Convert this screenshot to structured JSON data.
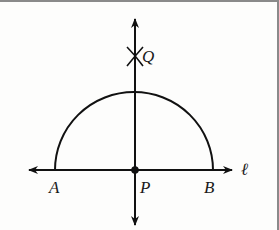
{
  "diagram": {
    "type": "geometric-construction",
    "colors": {
      "stroke": "#111111",
      "background": "#fdfdfc",
      "frame": "#8a8a8a"
    },
    "labels": {
      "A": "A",
      "B": "B",
      "P": "P",
      "Q": "Q",
      "line": "ℓ"
    },
    "points": {
      "A": [
        55,
        170
      ],
      "B": [
        213,
        170
      ],
      "P": [
        135,
        170
      ],
      "Q": [
        135,
        56
      ]
    },
    "lines": [
      {
        "name": "line-l",
        "from": [
          30,
          170
        ],
        "to": [
          232,
          170
        ],
        "arrows": "both"
      },
      {
        "name": "perpendicular",
        "from": [
          135,
          20
        ],
        "to": [
          135,
          224
        ],
        "arrows": "both"
      }
    ],
    "arcs": [
      {
        "name": "semicircle",
        "center": [
          135,
          170
        ],
        "radius": 79,
        "from": "A",
        "to": "B"
      }
    ],
    "marks": [
      {
        "name": "arc-intersection-x",
        "at": [
          135,
          56
        ]
      }
    ]
  }
}
